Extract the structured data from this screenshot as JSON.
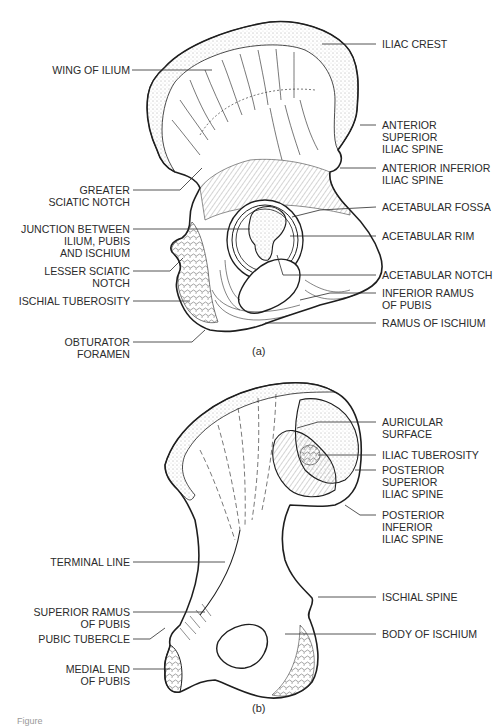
{
  "figure": {
    "caption_visible": "Figure",
    "panels": [
      {
        "id": "a",
        "tag": "(a)",
        "view": "lateral",
        "labels_left": [
          "WING OF ILIUM",
          "GREATER\nSCIATIC NOTCH",
          "JUNCTION BETWEEN\nILIUM, PUBIS\nAND ISCHIUM",
          "LESSER SCIATIC\nNOTCH",
          "ISCHIAL TUBEROSITY",
          "OBTURATOR\nFORAMEN"
        ],
        "labels_right": [
          "ILIAC CREST",
          "ANTERIOR\nSUPERIOR\nILIAC SPINE",
          "ANTERIOR INFERIOR\nILIAC SPINE",
          "ACETABULAR FOSSA",
          "ACETABULAR RIM",
          "ACETABULAR NOTCH",
          "INFERIOR RAMUS\nOF PUBIS",
          "RAMUS OF ISCHIUM"
        ]
      },
      {
        "id": "b",
        "tag": "(b)",
        "view": "medial",
        "labels_left": [
          "TERMINAL LINE",
          "SUPERIOR RAMUS\nOF PUBIS",
          "PUBIC TUBERCLE",
          "MEDIAL END\nOF PUBIS"
        ],
        "labels_right": [
          "AURICULAR\nSURFACE",
          "ILIAC TUBEROSITY",
          "POSTERIOR\nSUPERIOR\nILIAC SPINE",
          "POSTERIOR\nINFERIOR\nILIAC SPINE",
          "ISCHIAL SPINE",
          "BODY OF ISCHIUM"
        ]
      }
    ]
  }
}
